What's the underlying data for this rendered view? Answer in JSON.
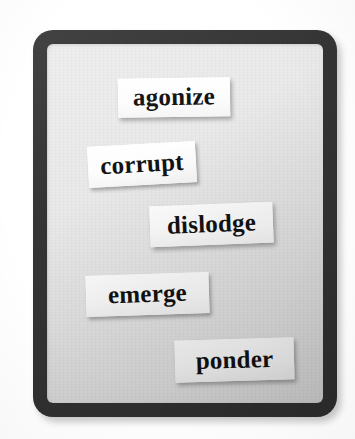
{
  "scene": {
    "title": "word magnet board",
    "description": "A dark rounded rectangular board holding five printed paper word slips",
    "background_color": "#ffffff"
  },
  "board": {
    "frame_color": "#343434",
    "panel_color": "#e9e9e9",
    "corner_radius_px": 20,
    "border_thickness_px": 14
  },
  "slips": [
    {
      "id": "agonize",
      "word": "agonize",
      "paper_color": "#fdfdfd",
      "text_color": "#121212",
      "rotation_deg": -0.8,
      "order": 1
    },
    {
      "id": "corrupt",
      "word": "corrupt",
      "paper_color": "#fdfdfd",
      "text_color": "#121212",
      "rotation_deg": -3.2,
      "order": 2
    },
    {
      "id": "dislodge",
      "word": "dislodge",
      "paper_color": "#fdfdfd",
      "text_color": "#121212",
      "rotation_deg": -2.2,
      "order": 3
    },
    {
      "id": "emerge",
      "word": "emerge",
      "paper_color": "#fdfdfd",
      "text_color": "#121212",
      "rotation_deg": -1.8,
      "order": 4
    },
    {
      "id": "ponder",
      "word": "ponder",
      "paper_color": "#fdfdfd",
      "text_color": "#121212",
      "rotation_deg": -1.6,
      "order": 5
    }
  ]
}
